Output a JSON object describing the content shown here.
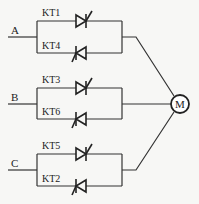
{
  "diagram": {
    "type": "circuit-schematic",
    "colors": {
      "line": "#333333",
      "background": "#f7f7f5"
    },
    "phases": [
      {
        "label": "A",
        "thyristor_top": "KT1",
        "thyristor_bottom": "KT4"
      },
      {
        "label": "B",
        "thyristor_top": "KT3",
        "thyristor_bottom": "KT6"
      },
      {
        "label": "C",
        "thyristor_top": "KT5",
        "thyristor_bottom": "KT2"
      }
    ],
    "load": {
      "label": "M",
      "icon": "motor-icon"
    }
  }
}
